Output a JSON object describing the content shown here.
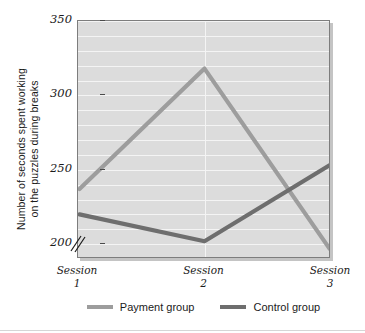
{
  "chart_data": {
    "type": "line",
    "title": "",
    "xlabel": "",
    "ylabel": "Number of seconds spent working on the puzzles during breaks",
    "ylabel_line1": "Number of seconds spent working",
    "ylabel_line2": "on the puzzles during breaks",
    "categories": [
      "Session 1",
      "Session 2",
      "Session 3"
    ],
    "x_tick_lines": [
      {
        "word": "Session",
        "num": "1"
      },
      {
        "word": "Session",
        "num": "2"
      },
      {
        "word": "Session",
        "num": "3"
      }
    ],
    "ylim": [
      190,
      350
    ],
    "y_ticks": [
      200,
      250,
      300,
      350
    ],
    "y_tick_labels": [
      "200",
      "250",
      "300",
      "350"
    ],
    "y_gridline_step": 10,
    "axis_break": true,
    "axis_break_symbol": "//",
    "grid": true,
    "legend_position": "bottom",
    "plot_background": "#dcdcdc",
    "gridline_color": "#f4f4f4",
    "series": [
      {
        "name": "Payment group",
        "color": "#9d9d9d",
        "values": [
          237,
          318,
          197
        ]
      },
      {
        "name": "Control group",
        "color": "#6e6e6e",
        "values": [
          220,
          202,
          253
        ]
      }
    ]
  },
  "legend": {
    "entries": [
      {
        "label": "Payment group",
        "color": "#9d9d9d"
      },
      {
        "label": "Control group",
        "color": "#6e6e6e"
      }
    ]
  }
}
